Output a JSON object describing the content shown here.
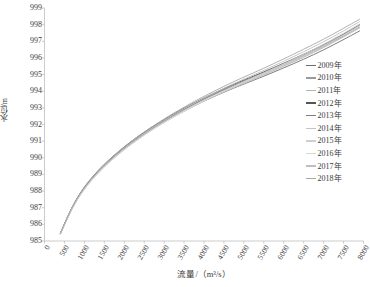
{
  "chart_data": {
    "type": "line",
    "title": "",
    "xlabel": "流量/（m³/s）",
    "ylabel": "水位/m",
    "xlim": [
      0,
      8000
    ],
    "ylim": [
      985,
      999
    ],
    "xticks": [
      0,
      500,
      1000,
      1500,
      2000,
      2500,
      3000,
      3500,
      4000,
      4500,
      5000,
      5500,
      6000,
      6500,
      7000,
      7500,
      8000
    ],
    "xtick_labels": [
      "0",
      "500",
      "1000",
      "1500",
      "2000",
      "2500",
      "3000",
      "3500",
      "4000",
      "4500",
      "5000",
      "5500",
      "6000",
      "6500",
      "7000",
      "7500",
      "8000"
    ],
    "yticks": [
      985,
      986,
      987,
      988,
      989,
      990,
      991,
      992,
      993,
      994,
      995,
      996,
      997,
      998,
      999
    ],
    "ytick_labels": [
      "985",
      "986",
      "987",
      "988",
      "989",
      "990",
      "991",
      "992",
      "993",
      "994",
      "995",
      "996",
      "997",
      "998",
      "999"
    ],
    "grid": false,
    "legend_position": "right",
    "x": [
      400,
      600,
      800,
      1000,
      1250,
      1500,
      1750,
      2000,
      2250,
      2500,
      2750,
      3000,
      3250,
      3500,
      3750,
      4000,
      4250,
      4500,
      4750,
      5000,
      5500,
      6000,
      6500,
      7000,
      7500,
      7900
    ],
    "series": [
      {
        "name": "2009年",
        "color": "#6e6e6e",
        "values": [
          985.45,
          986.55,
          987.45,
          988.18,
          988.9,
          989.52,
          990.06,
          990.55,
          991.0,
          991.42,
          991.8,
          992.16,
          992.5,
          992.82,
          993.12,
          993.41,
          993.68,
          993.94,
          994.19,
          994.43,
          994.9,
          995.4,
          995.92,
          996.48,
          997.1,
          997.62
        ]
      },
      {
        "name": "2010年",
        "color": "#9a9a9a",
        "values": [
          985.45,
          986.56,
          987.47,
          988.2,
          988.93,
          989.55,
          990.09,
          990.58,
          991.04,
          991.46,
          991.85,
          992.22,
          992.57,
          992.9,
          993.21,
          993.51,
          993.79,
          994.06,
          994.32,
          994.57,
          995.06,
          995.58,
          996.12,
          996.7,
          997.32,
          997.85
        ]
      },
      {
        "name": "2011年",
        "color": "#b4b4b4",
        "values": [
          985.44,
          986.54,
          987.44,
          988.16,
          988.88,
          989.5,
          990.04,
          990.53,
          990.98,
          991.4,
          991.79,
          992.15,
          992.49,
          992.82,
          993.13,
          993.43,
          993.71,
          993.98,
          994.24,
          994.49,
          994.98,
          995.5,
          996.04,
          996.62,
          997.26,
          997.8
        ]
      },
      {
        "name": "2012年",
        "color": "#555555",
        "values": [
          985.48,
          986.6,
          987.52,
          988.26,
          988.99,
          989.62,
          990.16,
          990.66,
          991.12,
          991.54,
          991.93,
          992.3,
          992.65,
          992.98,
          993.3,
          993.6,
          993.88,
          994.16,
          994.42,
          994.67,
          995.16,
          995.68,
          996.22,
          996.8,
          997.44,
          998.0
        ]
      },
      {
        "name": "2013年",
        "color": "#7d7d7d",
        "values": [
          985.46,
          986.57,
          987.48,
          988.21,
          988.94,
          989.56,
          990.1,
          990.6,
          991.06,
          991.48,
          991.87,
          992.24,
          992.59,
          992.92,
          993.24,
          993.54,
          993.83,
          994.1,
          994.36,
          994.62,
          995.12,
          995.64,
          996.18,
          996.76,
          997.4,
          997.95
        ]
      },
      {
        "name": "2014年",
        "color": "#c4c4c4",
        "values": [
          985.43,
          986.53,
          987.42,
          988.14,
          988.86,
          989.47,
          990.01,
          990.5,
          990.95,
          991.37,
          991.76,
          992.12,
          992.46,
          992.79,
          993.1,
          993.4,
          993.68,
          993.96,
          994.22,
          994.47,
          994.97,
          995.5,
          996.05,
          996.64,
          997.28,
          997.84
        ]
      },
      {
        "name": "2015年",
        "color": "#cfcfcf",
        "values": [
          985.42,
          986.52,
          987.41,
          988.13,
          988.85,
          989.46,
          990.0,
          990.49,
          990.94,
          991.36,
          991.75,
          992.12,
          992.47,
          992.8,
          993.12,
          993.42,
          993.71,
          993.99,
          994.26,
          994.52,
          995.03,
          995.57,
          996.13,
          996.73,
          997.38,
          997.94
        ]
      },
      {
        "name": "2016年",
        "color": "#d8d8d8",
        "values": [
          985.41,
          986.51,
          987.4,
          988.12,
          988.84,
          989.45,
          989.99,
          990.48,
          990.94,
          991.36,
          991.76,
          992.13,
          992.48,
          992.82,
          993.14,
          993.45,
          993.74,
          994.03,
          994.3,
          994.57,
          995.09,
          995.64,
          996.21,
          996.82,
          997.48,
          998.04
        ]
      },
      {
        "name": "2017年",
        "color": "#bfbfbf",
        "values": [
          985.44,
          986.55,
          987.45,
          988.18,
          988.91,
          989.53,
          990.08,
          990.58,
          991.04,
          991.47,
          991.87,
          992.25,
          992.61,
          992.95,
          993.28,
          993.59,
          993.89,
          994.18,
          994.46,
          994.73,
          995.25,
          995.8,
          996.37,
          996.97,
          997.62,
          998.18
        ]
      },
      {
        "name": "2018年",
        "color": "#a8a8a8",
        "values": [
          985.47,
          986.58,
          987.5,
          988.24,
          988.97,
          989.6,
          990.15,
          990.65,
          991.12,
          991.55,
          991.95,
          992.33,
          992.7,
          993.04,
          993.38,
          993.69,
          994.0,
          994.29,
          994.58,
          994.85,
          995.38,
          995.94,
          996.52,
          997.12,
          997.78,
          998.32
        ]
      }
    ]
  },
  "axis": {
    "color": "#bfbfbf"
  }
}
